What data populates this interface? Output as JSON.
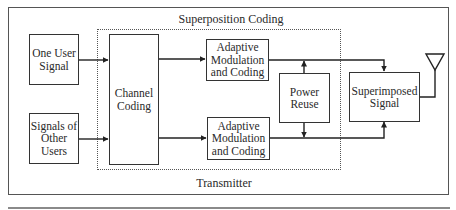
{
  "diagram": {
    "superposition_title": "Superposition Coding",
    "transmitter_label": "Transmitter",
    "blocks": {
      "one_user": "One User\nSignal",
      "other_users": "Signals of\nOther\nUsers",
      "channel_coding": "Channel\nCoding",
      "amc_top": "Adaptive\nModulation\nand Coding",
      "amc_bottom": "Adaptive\nModulation\nand Coding",
      "power_reuse": "Power\nReuse",
      "superimposed": "Superimposed\nSignal"
    },
    "icons": {
      "antenna": "antenna-icon"
    },
    "colors": {
      "line": "#333333",
      "frame": "#555555",
      "background": "#ffffff"
    }
  }
}
